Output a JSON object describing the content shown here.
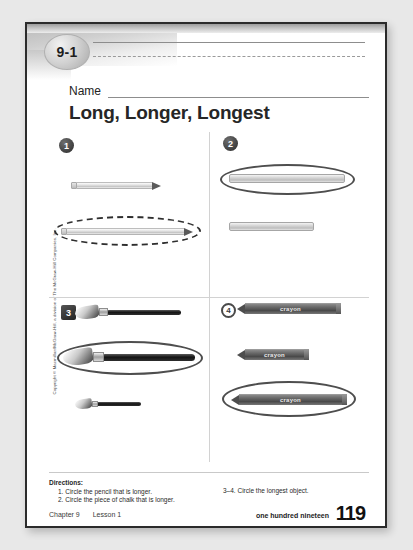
{
  "worksheet": {
    "lesson_badge": "9-1",
    "name_label": "Name",
    "title": "Long, Longer, Longest",
    "copyright": "Copyright © Macmillan/McGraw-Hill, a division of The McGraw-Hill Companies, Inc."
  },
  "exercises": [
    {
      "number": "1",
      "marker_style": "filled-circle",
      "objects": [
        {
          "type": "pencil",
          "label": "",
          "length_pct": 62,
          "circled": false
        },
        {
          "type": "pencil",
          "label": "",
          "length_pct": 96,
          "circled": true
        }
      ]
    },
    {
      "number": "2",
      "marker_style": "filled-circle",
      "objects": [
        {
          "type": "chalk",
          "label": "",
          "length_pct": 90,
          "circled": true
        },
        {
          "type": "chalk",
          "label": "",
          "length_pct": 66,
          "circled": false
        }
      ]
    },
    {
      "number": "3",
      "marker_style": "filled-square",
      "objects": [
        {
          "type": "paintbrush",
          "label": "",
          "length_pct": 74,
          "circled": false
        },
        {
          "type": "paintbrush",
          "label": "",
          "length_pct": 96,
          "circled": true
        },
        {
          "type": "paintbrush",
          "label": "",
          "length_pct": 48,
          "circled": false
        }
      ]
    },
    {
      "number": "4",
      "marker_style": "ring-circle",
      "objects": [
        {
          "type": "crayon",
          "label": "crayon",
          "length_pct": 84,
          "circled": false
        },
        {
          "type": "crayon",
          "label": "crayon",
          "length_pct": 58,
          "circled": false
        },
        {
          "type": "crayon",
          "label": "crayon",
          "length_pct": 92,
          "circled": true
        }
      ]
    }
  ],
  "directions": {
    "heading": "Directions:",
    "items": [
      "1. Circle the pencil that is longer.",
      "2. Circle the piece of chalk that is longer."
    ],
    "right_item": "3–4.  Circle the longest object."
  },
  "footer": {
    "chapter": "Chapter 9",
    "lesson": "Lesson 1",
    "page_words": "one hundred nineteen",
    "page_number": "119"
  }
}
